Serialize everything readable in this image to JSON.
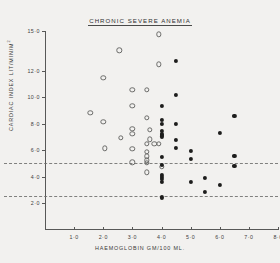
{
  "chart_data": {
    "type": "scatter",
    "title": "CHRONIC SEVERE ANEMIA",
    "xlabel": "HAEMOGLOBIN  GM/100 ML.",
    "ylabel_main": "CARDIAC INDEX  LIT/MIN/M",
    "ylabel_exponent": "2",
    "xlim": [
      0,
      8.0
    ],
    "ylim": [
      0,
      15.0
    ],
    "grid": false,
    "legend": "none",
    "xticks": [
      1.0,
      2.0,
      3.0,
      4.0,
      5.0,
      6.0,
      7.0,
      8.0
    ],
    "xtick_labels": [
      "1·0",
      "2·0",
      "3·0",
      "4·0",
      "5·0",
      "6·0",
      "7·0",
      "8·0"
    ],
    "yticks": [
      2.0,
      4.0,
      6.0,
      8.0,
      10.0,
      12.0,
      15.0
    ],
    "ytick_labels": [
      "2·0",
      "4·0",
      "6·0",
      "8·0",
      "10·0",
      "12·0",
      "15·0"
    ],
    "reference_lines": [
      {
        "name": "upper-normal-limit",
        "y": 5.05,
        "style": "dashed"
      },
      {
        "name": "lower-normal-limit",
        "y": 2.55,
        "style": "dashed"
      }
    ],
    "series": [
      {
        "name": "open-circle-series",
        "marker": "open-circle",
        "color": "#6b6b69",
        "points": [
          [
            1.55,
            8.85
          ],
          [
            2.0,
            11.45
          ],
          [
            2.0,
            8.15
          ],
          [
            2.05,
            6.15
          ],
          [
            2.55,
            13.55
          ],
          [
            2.6,
            6.95
          ],
          [
            3.0,
            10.55
          ],
          [
            3.0,
            9.35
          ],
          [
            3.0,
            7.65
          ],
          [
            3.0,
            7.25
          ],
          [
            3.0,
            6.1
          ],
          [
            3.0,
            5.1
          ],
          [
            3.5,
            10.55
          ],
          [
            3.5,
            8.45
          ],
          [
            3.5,
            6.5
          ],
          [
            3.5,
            5.9
          ],
          [
            3.5,
            5.55
          ],
          [
            3.5,
            5.25
          ],
          [
            3.5,
            5.05
          ],
          [
            3.5,
            4.35
          ],
          [
            3.6,
            7.55
          ],
          [
            3.6,
            6.85
          ],
          [
            3.75,
            6.5
          ],
          [
            3.9,
            14.75
          ],
          [
            3.9,
            12.5
          ],
          [
            3.9,
            6.5
          ],
          [
            4.0,
            4.75
          ]
        ]
      },
      {
        "name": "filled-circle-series",
        "marker": "filled-circle",
        "color": "#1d1d1c",
        "points": [
          [
            4.0,
            9.35
          ],
          [
            4.0,
            8.3
          ],
          [
            4.0,
            8.0
          ],
          [
            4.0,
            7.45
          ],
          [
            4.0,
            7.25
          ],
          [
            4.0,
            7.15
          ],
          [
            4.0,
            7.05
          ],
          [
            4.0,
            5.5
          ],
          [
            4.0,
            4.9
          ],
          [
            4.0,
            4.15
          ],
          [
            4.0,
            4.0
          ],
          [
            4.0,
            3.85
          ],
          [
            4.0,
            3.65
          ],
          [
            4.0,
            2.45
          ],
          [
            4.5,
            12.75
          ],
          [
            4.5,
            10.2
          ],
          [
            4.5,
            8.0
          ],
          [
            4.5,
            6.8
          ],
          [
            4.5,
            6.2
          ],
          [
            5.0,
            5.95
          ],
          [
            5.0,
            5.35
          ],
          [
            5.0,
            3.6
          ],
          [
            5.5,
            3.95
          ],
          [
            5.5,
            2.9
          ],
          [
            6.0,
            7.3
          ],
          [
            6.0,
            3.4
          ],
          [
            6.5,
            8.6
          ],
          [
            6.5,
            5.6
          ],
          [
            6.5,
            4.85
          ]
        ]
      }
    ]
  }
}
